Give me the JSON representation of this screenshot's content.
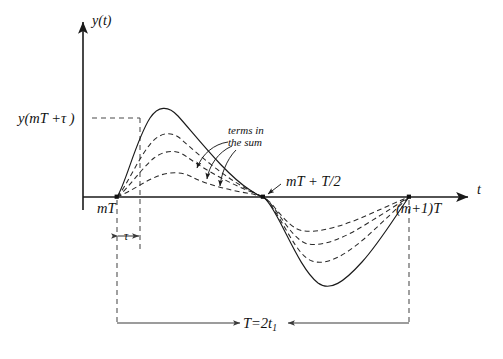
{
  "figure": {
    "background_color": "#ffffff",
    "ink_color": "#111111"
  },
  "axes": {
    "y_axis_label": "y(t)",
    "t_axis_label": "t",
    "origin_x": 83,
    "baseline_y": 197
  },
  "labels": {
    "y_value_label": "y(mT +τ )",
    "start_label": "mT",
    "half_period_label": "mT + T/2",
    "end_label": "(m+1)T",
    "tau_label": "τ",
    "period_label_main": "T=2t",
    "period_label_sub": "1",
    "annotation_line1": "terms in",
    "annotation_line2": "the sum"
  },
  "chart_data": {
    "type": "line",
    "title": "",
    "xlabel": "t",
    "ylabel": "y(t)",
    "grid": false,
    "legend": "none",
    "x_markers": [
      {
        "name": "mT",
        "px": 117,
        "label": "mT"
      },
      {
        "name": "mT+tau",
        "px": 140,
        "label": "τ offset"
      },
      {
        "name": "mT+T/2",
        "px": 263,
        "label": "mT + T/2"
      },
      {
        "name": "(m+1)T",
        "px": 409,
        "label": "(m+1)T"
      }
    ],
    "y_markers": [
      {
        "name": "y(mT+tau)",
        "px": 118,
        "label": "y(mT +τ )"
      }
    ],
    "series": [
      {
        "name": "sum-total",
        "style": "solid",
        "peak_px": {
          "x": 155,
          "y": 110
        },
        "trough_px": {
          "x": 318,
          "y": 285
        },
        "path": "M 117 197 C 126 183 136 140 150 118 C 158 106 168 105 178 116 C 196 136 226 175 250 190 C 256 194 260 196 263 197 C 267 199 272 207 280 222 C 292 245 304 272 318 283 C 330 292 344 282 362 262 C 380 242 396 215 409 197"
      },
      {
        "name": "term-1",
        "style": "dashed",
        "peak_px": {
          "x": 162,
          "y": 133
        },
        "trough_px": {
          "x": 312,
          "y": 262
        },
        "path": "M 117 197 C 127 186 138 158 152 142 C 160 133 172 130 182 140 C 200 156 228 180 251 191 C 257 194 260 196 263 197 C 267 199 271 205 278 216 C 290 236 300 257 312 261 C 326 266 344 256 364 239 C 382 223 397 208 409 197"
      },
      {
        "name": "term-2",
        "style": "dashed",
        "peak_px": {
          "x": 168,
          "y": 150
        },
        "trough_px": {
          "x": 308,
          "y": 244
        },
        "path": "M 117 197 C 128 189 140 170 154 158 C 163 151 176 148 187 157 C 204 169 230 184 252 192 C 258 195 261 196 263 197 C 267 199 271 204 277 212 C 288 228 298 242 308 244 C 324 247 346 237 368 223 C 386 212 398 204 409 197"
      },
      {
        "name": "term-3",
        "style": "dashed",
        "peak_px": {
          "x": 176,
          "y": 172
        },
        "trough_px": {
          "x": 304,
          "y": 231
        },
        "path": "M 117 197 C 130 192 143 182 158 176 C 168 172 182 171 192 177 C 208 185 232 191 253 194 C 259 196 261 197 263 197 C 267 199 270 202 275 208 C 286 221 294 230 304 231 C 322 233 348 224 370 214 C 388 206 399 201 409 197"
      }
    ],
    "annotations": [
      {
        "text": "terms in the sum",
        "leader_targets_px": [
          {
            "x": 196,
            "y": 174
          },
          {
            "x": 207,
            "y": 185
          },
          {
            "x": 220,
            "y": 192
          }
        ]
      }
    ],
    "dimensions": [
      {
        "name": "tau",
        "label": "τ",
        "from_px": 117,
        "to_px": 140,
        "y_px": 236
      },
      {
        "name": "period",
        "label": "T=2t1",
        "from_px": 117,
        "to_px": 409,
        "y_px": 323
      }
    ]
  }
}
